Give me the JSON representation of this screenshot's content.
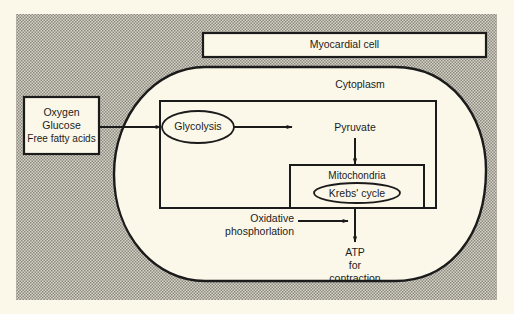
{
  "diagram": {
    "title_box": {
      "label": "Myocardial cell"
    },
    "region_label": "Cytoplasm",
    "inputs_box": {
      "lines": [
        "Oxygen",
        "Glucose",
        "Free fatty acids"
      ]
    },
    "process_glycolysis": {
      "label": "Glycolysis"
    },
    "product_pyruvate": {
      "label": "Pyruvate"
    },
    "organelle_mitochondria": {
      "label": "Mitochondria"
    },
    "process_krebs": {
      "label": "Krebs' cycle"
    },
    "process_oxidative": {
      "lines": [
        "Oxidative",
        "phosphorlation"
      ]
    },
    "output_atp": {
      "lines": [
        "ATP",
        "for",
        "contraction"
      ]
    },
    "colors": {
      "paper": "#fbf8ea",
      "stipple_bg": "#cfccbf",
      "stipple_dot": "#8c8a80",
      "stroke": "#1b1b1b"
    },
    "flows": [
      {
        "from": "inputs_box",
        "to": "process_glycolysis"
      },
      {
        "from": "process_glycolysis",
        "to": "product_pyruvate"
      },
      {
        "from": "product_pyruvate",
        "to": "organelle_mitochondria"
      },
      {
        "from": "process_oxidative",
        "to": "output_atp"
      },
      {
        "from": "organelle_mitochondria",
        "to": "output_atp"
      }
    ]
  }
}
